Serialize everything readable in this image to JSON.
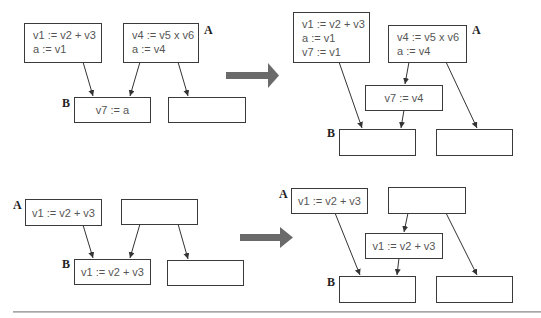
{
  "diagram": {
    "colors": {
      "box_border": "#3a3a3a",
      "text": "#555555",
      "edge": "#333333",
      "transform_arrow": "#6a6a6a",
      "divider": "#aaaaaa"
    },
    "example1": {
      "before": {
        "block_A_left": {
          "lines": [
            "v1 := v2 + v3",
            "a := v1"
          ]
        },
        "block_A_right": {
          "lines": [
            "v4 := v5 x v6",
            "a := v4"
          ],
          "label": "A"
        },
        "block_B": {
          "lines": [
            "v7 := a"
          ],
          "label": "B"
        },
        "block_other": {
          "lines": []
        }
      },
      "transform_arrow": "right-arrow-icon",
      "after": {
        "block_A_left": {
          "lines": [
            "v1 := v2 + v3",
            "a := v1",
            "v7 := v1"
          ]
        },
        "block_A_right": {
          "lines": [
            "v4 := v5 x v6",
            "a := v4"
          ],
          "label": "A"
        },
        "block_inserted": {
          "lines": [
            "v7 := v4"
          ]
        },
        "block_B": {
          "lines": [],
          "label": "B"
        },
        "block_other": {
          "lines": []
        }
      }
    },
    "example2": {
      "before": {
        "block_A": {
          "lines": [
            "v1 := v2 + v3"
          ],
          "label": "A"
        },
        "block_right": {
          "lines": []
        },
        "block_B": {
          "lines": [
            "v1 := v2 + v3"
          ],
          "label": "B"
        },
        "block_other": {
          "lines": []
        }
      },
      "transform_arrow": "right-arrow-icon",
      "after": {
        "block_A": {
          "lines": [
            "v1 := v2 + v3"
          ],
          "label": "A"
        },
        "block_right": {
          "lines": []
        },
        "block_inserted": {
          "lines": [
            "v1 := v2 + v3"
          ]
        },
        "block_B": {
          "lines": [],
          "label": "B"
        },
        "block_other": {
          "lines": []
        }
      }
    }
  }
}
